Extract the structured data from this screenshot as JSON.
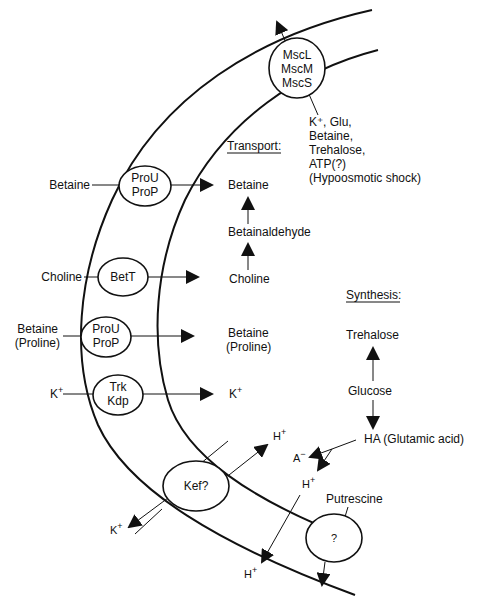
{
  "figure": {
    "type": "membrane osmoregulation diagram",
    "membrane": {
      "description": "curved double-line cell envelope"
    }
  },
  "channels": {
    "mechanosensitive": {
      "lines": [
        "MscL",
        "MscM",
        "MscS"
      ]
    },
    "proU_proP_1": {
      "lines": [
        "ProU",
        "ProP"
      ]
    },
    "betT": {
      "lines": [
        "BetT"
      ]
    },
    "proU_proP_2": {
      "lines": [
        "ProU",
        "ProP"
      ]
    },
    "trk_kdp": {
      "lines": [
        "Trk",
        "Kdp"
      ]
    },
    "kef": {
      "lines": [
        "Kef?"
      ]
    },
    "unknown": {
      "lines": [
        "?"
      ]
    }
  },
  "efflux": {
    "lines": [
      "K⁺, Glu,",
      "Betaine,",
      "Trehalose,",
      "ATP(?)",
      "(Hypoosmotic shock)"
    ]
  },
  "outside_labels": {
    "betaine1": "Betaine",
    "choline": "Choline",
    "betaine2": "Betaine",
    "proline2": "(Proline)",
    "k_in": "K",
    "k_out_kef": "K",
    "h_out_kef": "H",
    "h_bottom": "H"
  },
  "transport": {
    "heading": "Transport:",
    "betaine": "Betaine",
    "betainaldehyde": "Betainaldehyde",
    "choline": "Choline",
    "betaine2": "Betaine",
    "proline2": "(Proline)",
    "k": "K"
  },
  "synthesis": {
    "heading": "Synthesis:",
    "trehalose": "Trehalose",
    "glucose": "Glucose",
    "ha": "HA (Glutamic acid)",
    "a_minus": "A",
    "h_plus": "H",
    "putrescine": "Putrescine"
  },
  "superscripts": {
    "plus": "+",
    "minus": "−"
  }
}
